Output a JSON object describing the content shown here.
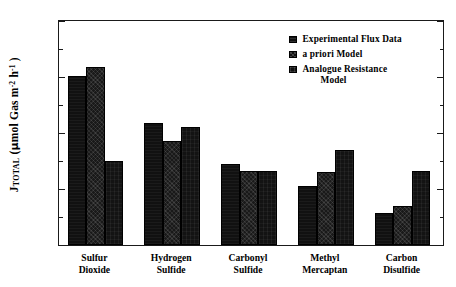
{
  "chart_data": {
    "type": "bar",
    "title": "",
    "subtitle": "",
    "xlabel": "",
    "ylabel": "J_TOTAL (µmol Gas m^-2 h^-1)",
    "ylabel_parts": {
      "symbol": "J",
      "subscript": "TOTAL",
      "units_open": " (",
      "mu": "µ",
      "units_text_1": "mol Gas m",
      "exp_1": "-2",
      "units_text_2": " h",
      "exp_2": "-1",
      "units_close": " )"
    },
    "categories": [
      "Sulfur Dioxide",
      "Hydrogen Sulfide",
      "Carbonyl Sulfide",
      "Methyl Mercaptan",
      "Carbon Disulfide"
    ],
    "category_lines": [
      [
        "Sulfur",
        "Dioxide"
      ],
      [
        "Hydrogen",
        "Sulfide"
      ],
      [
        "Carbonyl",
        "Sulfide"
      ],
      [
        "Methyl",
        "Mercaptan"
      ],
      [
        "Carbon",
        "Disulfide"
      ]
    ],
    "series": [
      {
        "name": "Experimental  Flux  Data",
        "values": [
          60.5,
          43.5,
          29.0,
          21.0,
          11.5
        ]
      },
      {
        "name": "a priori Model",
        "values": [
          63.5,
          37.0,
          26.5,
          26.0,
          14.0
        ]
      },
      {
        "name": "Analogue Resistance\nModel",
        "values": [
          30.0,
          42.0,
          26.5,
          34.0,
          26.5
        ]
      }
    ],
    "ylim": [
      0,
      80
    ],
    "yticks": [
      0,
      20,
      40,
      60,
      80
    ],
    "ytick_labels": [
      "0",
      "20",
      "40",
      "60",
      "80"
    ],
    "yticks_minor": [
      10,
      30,
      50,
      70
    ],
    "grid": false,
    "legend_position": "upper right",
    "colors": {
      "series_1": "#111111",
      "series_2": "#191919",
      "series_3": "#131313",
      "axis": "#1a1a1a",
      "background": "#ffffff"
    }
  }
}
